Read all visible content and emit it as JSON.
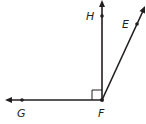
{
  "diagram": {
    "type": "geometry-angles",
    "points": {
      "F": {
        "label": "F",
        "x": 102,
        "y": 100
      },
      "H": {
        "label": "H",
        "x": 102,
        "y": 16
      },
      "E": {
        "label": "E",
        "x": 137,
        "y": 24
      },
      "G": {
        "label": "G",
        "x": 22,
        "y": 100
      }
    },
    "rays": [
      {
        "from": "F",
        "through": "H"
      },
      {
        "from": "F",
        "through": "E"
      },
      {
        "from": "F",
        "through": "G"
      }
    ],
    "right_angle_marker": {
      "at": "F",
      "between": [
        "G",
        "H"
      ]
    },
    "stroke_color": "#231f20"
  }
}
